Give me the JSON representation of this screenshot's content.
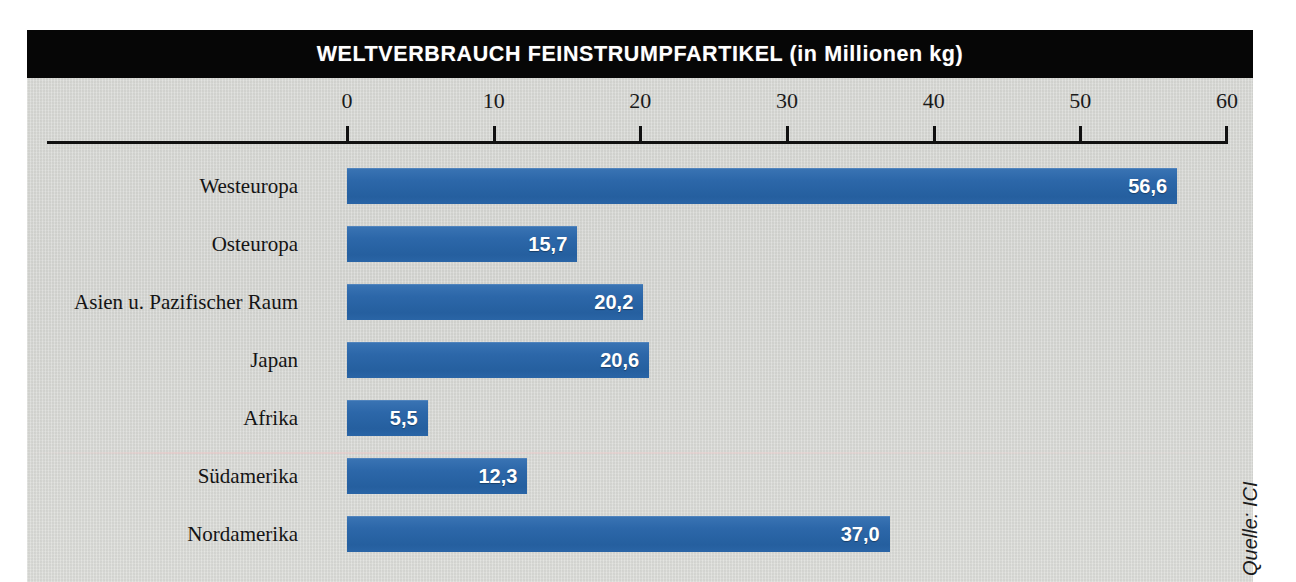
{
  "title": "WELTVERBRAUCH FEINSTRUMPFARTIKEL (in Millionen kg)",
  "source_note": "Quelle: ICI",
  "colors": {
    "bar": "#2c67a9",
    "plate_background": "#d5d6d2",
    "title_bar": "#060606",
    "axis": "#111111",
    "value_label": "#ffffff",
    "category_label": "#141414"
  },
  "axis": {
    "ticks": [
      "0",
      "10",
      "20",
      "30",
      "40",
      "50",
      "60"
    ],
    "min": 0,
    "max": 60,
    "step": 10
  },
  "chart_data": {
    "type": "bar",
    "orientation": "horizontal",
    "title": "WELTVERBRAUCH FEINSTRUMPFARTIKEL (in Millionen kg)",
    "xlabel": "",
    "ylabel": "",
    "unit": "Millionen kg",
    "xlim": [
      0,
      60
    ],
    "xticks": [
      0,
      10,
      20,
      30,
      40,
      50,
      60
    ],
    "grid": false,
    "legend": null,
    "decimal_separator": ",",
    "categories": [
      "Westeuropa",
      "Osteuropa",
      "Asien u. Pazifischer Raum",
      "Japan",
      "Afrika",
      "Südamerika",
      "Nordamerika"
    ],
    "values": [
      56.6,
      15.7,
      20.2,
      20.6,
      5.5,
      12.3,
      37.0
    ],
    "value_labels": [
      "56,6",
      "15,7",
      "20,2",
      "20,6",
      "5,5",
      "12,3",
      "37,0"
    ],
    "annotations": [
      "Quelle: ICI"
    ]
  },
  "rows": [
    {
      "label": "Westeuropa",
      "value": 56.6,
      "value_label": "56,6"
    },
    {
      "label": "Osteuropa",
      "value": 15.7,
      "value_label": "15,7"
    },
    {
      "label": "Asien u. Pazifischer Raum",
      "value": 20.2,
      "value_label": "20,2"
    },
    {
      "label": "Japan",
      "value": 20.6,
      "value_label": "20,6"
    },
    {
      "label": "Afrika",
      "value": 5.5,
      "value_label": "5,5"
    },
    {
      "label": "Südamerika",
      "value": 12.3,
      "value_label": "12,3"
    },
    {
      "label": "Nordamerika",
      "value": 37.0,
      "value_label": "37,0"
    }
  ]
}
